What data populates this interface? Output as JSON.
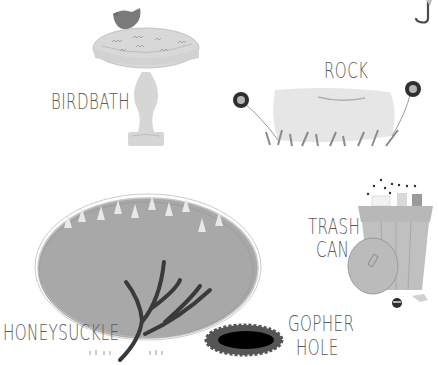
{
  "labels": {
    "birdbath": "BIRDBATH",
    "rock": "ROCK",
    "trash_can_line1": "TRASH",
    "trash_can_line2": "CAN",
    "honeysuckle": "HONEYSUCKLE",
    "gopher_hole_line1": "GOPHER",
    "gopher_hole_line2": "HOLE"
  },
  "colors": {
    "label": "#5a5a5a",
    "light_fill": "#dcdcdc",
    "mid_fill": "#b4b4b4",
    "dark": "#3c3c3c",
    "black": "#000000"
  }
}
